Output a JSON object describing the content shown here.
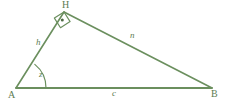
{
  "diagram": {
    "background_color": "#ffffff",
    "stroke_color": "#6b8f5e",
    "label_color": "#5d7c52",
    "vertices": {
      "A": {
        "label": "A",
        "x": 16,
        "y": 88
      },
      "B": {
        "label": "B",
        "x": 212,
        "y": 88
      },
      "H": {
        "label": "H",
        "x": 64,
        "y": 12
      }
    },
    "sides": [
      {
        "name": "leg-AH",
        "label": "h",
        "from": "A",
        "to": "H"
      },
      {
        "name": "leg-HB",
        "label": "n",
        "from": "H",
        "to": "B"
      },
      {
        "name": "base-AB",
        "label": "c",
        "from": "A",
        "to": "B"
      }
    ],
    "angles": [
      {
        "name": "angle-at-A",
        "label": "z",
        "vertex": "A",
        "marker": "arc"
      },
      {
        "name": "angle-at-H",
        "label": "",
        "vertex": "H",
        "marker": "right-angle-square-with-dot"
      }
    ]
  }
}
